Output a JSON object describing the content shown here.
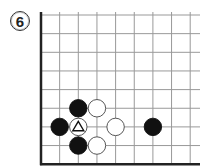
{
  "problem": {
    "number": "6"
  },
  "board": {
    "origin_x": 41,
    "origin_y": 15,
    "spacing": 18.65,
    "cols": 9,
    "rows": 9,
    "right_extent": 200,
    "edges": [
      "left",
      "bottom"
    ],
    "line_color": "#999999",
    "edge_color": "#222222"
  },
  "stones": [
    {
      "col": 2,
      "row": 5,
      "color": "black"
    },
    {
      "col": 3,
      "row": 5,
      "color": "white"
    },
    {
      "col": 1,
      "row": 6,
      "color": "black"
    },
    {
      "col": 2,
      "row": 6,
      "color": "white",
      "mark": "triangle"
    },
    {
      "col": 4,
      "row": 6,
      "color": "white"
    },
    {
      "col": 6,
      "row": 6,
      "color": "black"
    },
    {
      "col": 2,
      "row": 7,
      "color": "black"
    },
    {
      "col": 3,
      "row": 7,
      "color": "white"
    }
  ]
}
